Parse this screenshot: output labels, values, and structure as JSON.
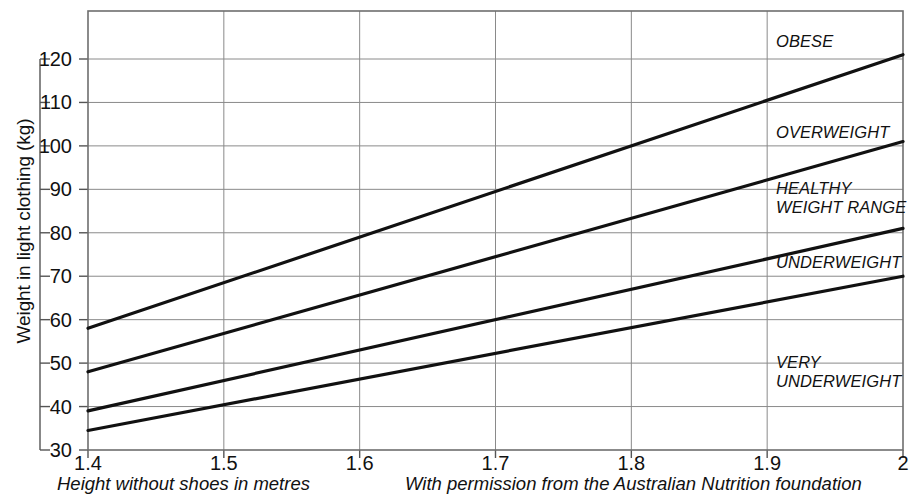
{
  "chart_data": {
    "type": "line",
    "title": "",
    "xlabel": "Height without shoes in metres",
    "ylabel": "Weight in light clothing (kg)",
    "xlim": [
      1.4,
      2.0
    ],
    "ylim": [
      30,
      126
    ],
    "grid": true,
    "legend_position": "inline-right",
    "x_ticks": [
      "1.4",
      "1.5",
      "1.6",
      "1.7",
      "1.8",
      "1.9",
      "2"
    ],
    "x_tick_values": [
      1.4,
      1.5,
      1.6,
      1.7,
      1.8,
      1.9,
      2.0
    ],
    "y_ticks": [
      "30",
      "40",
      "50",
      "60",
      "70",
      "80",
      "90",
      "100",
      "110",
      "120"
    ],
    "y_tick_values": [
      30,
      40,
      50,
      60,
      70,
      80,
      90,
      100,
      110,
      120
    ],
    "x": [
      1.4,
      2.0
    ],
    "series": [
      {
        "name": "Obese / Overweight boundary",
        "values": [
          58,
          121
        ]
      },
      {
        "name": "Overweight / Healthy boundary",
        "values": [
          48,
          101
        ]
      },
      {
        "name": "Healthy / Underweight boundary",
        "values": [
          39,
          81
        ]
      },
      {
        "name": "Underweight / Very underweight boundary",
        "values": [
          34.5,
          70
        ]
      }
    ],
    "annotations": [
      {
        "text": "OBESE",
        "x": 1.905,
        "y": 124
      },
      {
        "text": "OVERWEIGHT",
        "x": 1.905,
        "y": 103
      },
      {
        "text": "HEALTHY\nWEIGHT RANGE",
        "x": 1.905,
        "y": 90
      },
      {
        "text": "UNDERWEIGHT",
        "x": 1.905,
        "y": 73
      },
      {
        "text": "VERY\nUNDERWEIGHT",
        "x": 1.905,
        "y": 50
      }
    ],
    "credit": "With permission from the Australian Nutrition foundation",
    "colors": {
      "line": "#111111",
      "grid": "#8a8a8a",
      "axis": "#555555",
      "background": "#ffffff",
      "text": "#111111"
    }
  }
}
